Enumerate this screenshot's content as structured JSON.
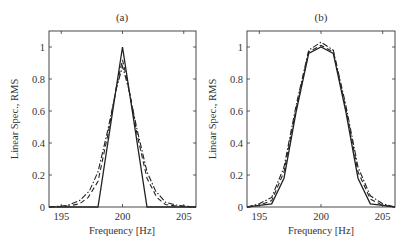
{
  "chart_data": [
    {
      "type": "line",
      "panel": "a",
      "title": "(a)",
      "xlabel": "Frequency [Hz]",
      "ylabel": "Linear Spec., RMS",
      "xlim": [
        194,
        206
      ],
      "ylim": [
        0,
        1.1
      ],
      "xticks": [
        195,
        200,
        205
      ],
      "yticks": [
        0,
        0.2,
        0.4,
        0.6,
        0.8,
        1
      ],
      "ytick_labels": [
        "0",
        "0.2",
        "0.4",
        "0.6",
        "0.8",
        "1"
      ],
      "grid": false,
      "legend": null,
      "series": [
        {
          "name": "solid",
          "style": "solid",
          "x": [
            194,
            198,
            200,
            202,
            206
          ],
          "y": [
            0,
            0,
            1.0,
            0,
            0
          ]
        },
        {
          "name": "dashed",
          "style": "dashed",
          "x": [
            194,
            195.5,
            196.5,
            197.2,
            198,
            198.8,
            199.5,
            200,
            200.5,
            201.2,
            202,
            202.8,
            203.5,
            204.5,
            206
          ],
          "y": [
            0,
            0.005,
            0.02,
            0.06,
            0.16,
            0.45,
            0.75,
            0.92,
            0.75,
            0.45,
            0.18,
            0.06,
            0.015,
            0.005,
            0
          ]
        },
        {
          "name": "dash-dot",
          "style": "dashdot",
          "x": [
            194,
            195.5,
            196.5,
            197.3,
            198,
            198.8,
            199.5,
            200,
            200.5,
            201.2,
            202,
            202.7,
            203.5,
            204.5,
            206
          ],
          "y": [
            0,
            0.01,
            0.04,
            0.1,
            0.22,
            0.48,
            0.74,
            0.88,
            0.74,
            0.48,
            0.22,
            0.1,
            0.03,
            0.01,
            0
          ]
        }
      ]
    },
    {
      "type": "line",
      "panel": "b",
      "title": "(b)",
      "xlabel": "Frequency [Hz]",
      "ylabel": "Linear Spec., RMS",
      "xlim": [
        194,
        206
      ],
      "ylim": [
        0,
        1.1
      ],
      "xticks": [
        195,
        200,
        205
      ],
      "yticks": [
        0,
        0.2,
        0.4,
        0.6,
        0.8,
        1
      ],
      "ytick_labels": [
        "0",
        "0.2",
        "0.4",
        "0.6",
        "0.8",
        "1"
      ],
      "grid": false,
      "legend": null,
      "series": [
        {
          "name": "solid",
          "style": "solid",
          "x": [
            194,
            195,
            196,
            197,
            198,
            199,
            200,
            201,
            202,
            203,
            204,
            205,
            206
          ],
          "y": [
            0,
            0.01,
            0.02,
            0.18,
            0.6,
            0.96,
            1.0,
            0.96,
            0.6,
            0.18,
            0.02,
            0.01,
            0
          ]
        },
        {
          "name": "dashed",
          "style": "dashed",
          "x": [
            194,
            195,
            196,
            197,
            198,
            199,
            200,
            201,
            202,
            203,
            204,
            205,
            206
          ],
          "y": [
            0,
            0.01,
            0.04,
            0.22,
            0.62,
            0.97,
            1.01,
            0.97,
            0.62,
            0.22,
            0.05,
            0.01,
            0
          ]
        },
        {
          "name": "dash-dot",
          "style": "dashdot",
          "x": [
            194,
            195,
            196,
            197,
            198,
            199,
            200,
            201,
            202,
            203,
            204,
            205,
            206
          ],
          "y": [
            0,
            0.02,
            0.06,
            0.25,
            0.64,
            0.98,
            1.03,
            0.98,
            0.64,
            0.25,
            0.07,
            0.02,
            0
          ]
        }
      ]
    }
  ]
}
